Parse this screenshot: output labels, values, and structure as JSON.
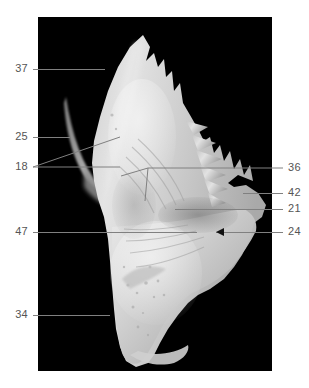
{
  "figure": {
    "background_color": "#ffffff",
    "panel_color": "#000000",
    "label_color": "#555555",
    "leader_color": "#808080",
    "specimen_color": "#d8d8d8",
    "panel": {
      "x": 38,
      "y": 17,
      "width": 234,
      "height": 354
    }
  },
  "callouts": {
    "left": [
      {
        "number": "37",
        "x": 14,
        "y": 63,
        "line_from_x": 33,
        "line_to_x": 105,
        "line_y": 69
      },
      {
        "number": "25",
        "x": 14,
        "y": 131,
        "line_from_x": 33,
        "line_to_x": 70,
        "line_y": 137
      },
      {
        "number": "18",
        "x": 14,
        "y": 161,
        "line_from_x": 33,
        "line_to_x": 120,
        "line_y": 167
      },
      {
        "number": "47",
        "x": 14,
        "y": 226,
        "line_from_x": 33,
        "line_to_x": 197,
        "line_y": 232
      },
      {
        "number": "34",
        "x": 14,
        "y": 309,
        "line_from_x": 33,
        "line_to_x": 110,
        "line_y": 315
      }
    ],
    "right": [
      {
        "number": "36",
        "x": 288,
        "y": 162,
        "line_from_x": 283,
        "line_to_x": 148,
        "line_y": 168
      },
      {
        "number": "42",
        "x": 288,
        "y": 187,
        "line_from_x": 283,
        "line_to_x": 243,
        "line_y": 193
      },
      {
        "number": "21",
        "x": 288,
        "y": 203,
        "line_from_x": 283,
        "line_to_x": 175,
        "line_y": 209
      },
      {
        "number": "24",
        "x": 288,
        "y": 226,
        "line_from_x": 283,
        "line_to_x": 212,
        "line_y": 232
      }
    ]
  },
  "icons": {
    "arrow_head": "arrowhead-icon",
    "specimen": "bone-specimen-icon"
  }
}
